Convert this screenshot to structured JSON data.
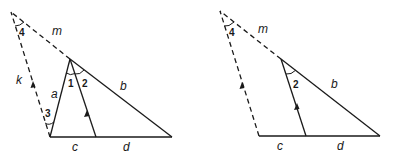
{
  "figures": [
    {
      "id": "left",
      "labels": {
        "m": "m",
        "k": "k",
        "a": "a",
        "b": "b",
        "c": "c",
        "d": "d",
        "angle1": "1",
        "angle2": "2",
        "angle3": "3",
        "angle4": "4"
      }
    },
    {
      "id": "right",
      "labels": {
        "m": "m",
        "b": "b",
        "c": "c",
        "d": "d",
        "angle2": "2",
        "angle4": "4"
      }
    }
  ],
  "colors": {
    "line": "#1a1a1a",
    "background": "#ffffff"
  }
}
